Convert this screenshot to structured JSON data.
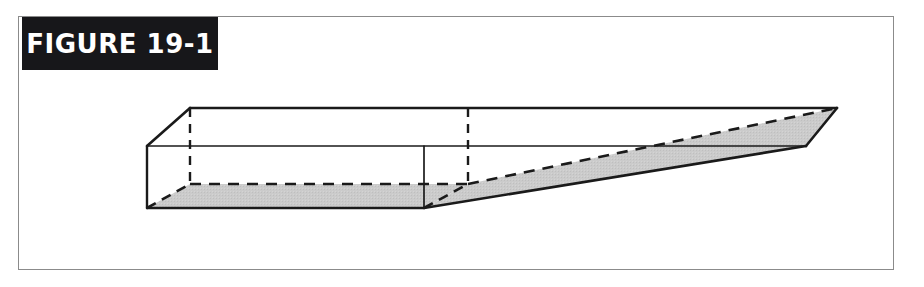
{
  "figure": {
    "label": "FIGURE 19-1",
    "caption": "",
    "background_color": "#ffffff",
    "frame_border_color": "#8b8b8b",
    "banner_background_color": "#17171a",
    "banner_text_color": "#ffffff"
  },
  "illustration": {
    "name": "tapered-rectangular-prism-wedge",
    "description": "Three-dimensional line drawing of a long rectangular box whose right-hand portion tapers to a thin wedge; hidden edges shown as dashed lines and the bottom/underside faces shaded gray.",
    "stroke_color": "#1a1a1a",
    "shaded_face_color": "#c9c9c9",
    "hidden_edge_style": "dashed",
    "visible_edge_style": "solid",
    "vertices": {
      "top_back_left": [
        190,
        108
      ],
      "top_front_left": [
        147,
        146
      ],
      "bottom_front_left": [
        147,
        208
      ],
      "bottom_back_left": [
        190,
        184
      ],
      "box_end_top_front": [
        424,
        146
      ],
      "box_end_bottom_front": [
        424,
        208
      ],
      "box_end_back_top": [
        468,
        108
      ],
      "box_end_back_bottom": [
        468,
        184
      ],
      "tip_top_back": [
        837,
        108
      ],
      "tip_front_lower": [
        806,
        146
      ],
      "wedge_front_upper": [
        700,
        146
      ]
    },
    "faces": [
      {
        "name": "top-face",
        "shaded": false
      },
      {
        "name": "front-face-box",
        "shaded": false
      },
      {
        "name": "left-end-face",
        "shaded": false
      },
      {
        "name": "bottom-face-box",
        "shaded": true
      },
      {
        "name": "wedge-underside",
        "shaded": true
      },
      {
        "name": "wedge-side-face",
        "shaded": true
      },
      {
        "name": "tip-end-face",
        "shaded": true
      }
    ]
  }
}
